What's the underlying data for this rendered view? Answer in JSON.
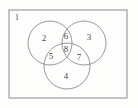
{
  "figure": {
    "type": "venn-diagram-3-set",
    "background_color": "#fdfdfc",
    "stroke_color": "#8c8c8c",
    "label_color": "#4a4a4a",
    "rectangle": {
      "x": 9,
      "y": 10,
      "width": 118,
      "height": 88
    },
    "circles": [
      {
        "name": "left-circle",
        "cx": 50,
        "cy": 43,
        "r": 22
      },
      {
        "name": "right-circle",
        "cx": 84,
        "cy": 43,
        "r": 22
      },
      {
        "name": "bottom-circle",
        "cx": 67,
        "cy": 66,
        "r": 23
      }
    ],
    "labels": [
      {
        "id": "universe",
        "text": "1",
        "x": 17,
        "y": 18
      },
      {
        "id": "left-only",
        "text": "2",
        "x": 44,
        "y": 39
      },
      {
        "id": "right-only",
        "text": "3",
        "x": 89,
        "y": 38
      },
      {
        "id": "bottom-only",
        "text": "4",
        "x": 66,
        "y": 77
      },
      {
        "id": "left-bottom",
        "text": "5",
        "x": 51,
        "y": 57
      },
      {
        "id": "left-right",
        "text": "6",
        "x": 66,
        "y": 37
      },
      {
        "id": "right-bottom",
        "text": "7",
        "x": 79,
        "y": 58
      },
      {
        "id": "left-right-bottom",
        "text": "8",
        "x": 66,
        "y": 50
      }
    ]
  }
}
